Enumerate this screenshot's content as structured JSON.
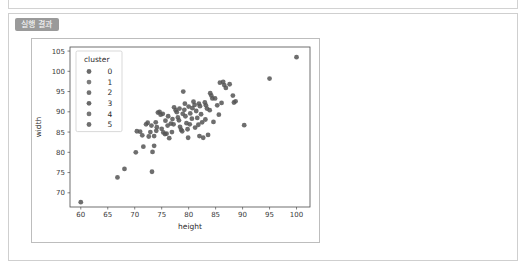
{
  "panel": {
    "result_tag": "실행 결과"
  },
  "chart_data": {
    "type": "scatter",
    "title": "",
    "xlabel": "height",
    "ylabel": "width",
    "xlim": [
      58.0,
      102.5
    ],
    "ylim": [
      66.5,
      106.0
    ],
    "xticks": [
      60,
      65,
      70,
      75,
      80,
      85,
      90,
      95,
      100
    ],
    "yticks": [
      70,
      75,
      80,
      85,
      90,
      95,
      100,
      105
    ],
    "grid": false,
    "legend": {
      "title": "cluster",
      "position": "upper left",
      "entries": [
        {
          "label": "0",
          "color": "#5a5a5a"
        },
        {
          "label": "1",
          "color": "#6e6e6e"
        },
        {
          "label": "2",
          "color": "#626262"
        },
        {
          "label": "3",
          "color": "#585858"
        },
        {
          "label": "4",
          "color": "#676767"
        },
        {
          "label": "5",
          "color": "#5f5f5f"
        }
      ]
    },
    "marker": {
      "size": 2.4,
      "color": "#555555",
      "opacity": 0.85
    },
    "points": [
      {
        "x": 60.0,
        "y": 67.7
      },
      {
        "x": 66.8,
        "y": 73.8
      },
      {
        "x": 68.1,
        "y": 75.9
      },
      {
        "x": 73.2,
        "y": 75.2
      },
      {
        "x": 70.2,
        "y": 80.0
      },
      {
        "x": 73.3,
        "y": 80.1
      },
      {
        "x": 71.6,
        "y": 81.4
      },
      {
        "x": 73.6,
        "y": 81.6
      },
      {
        "x": 70.4,
        "y": 85.2
      },
      {
        "x": 71.0,
        "y": 85.1
      },
      {
        "x": 71.4,
        "y": 84.2
      },
      {
        "x": 72.1,
        "y": 86.9
      },
      {
        "x": 72.4,
        "y": 87.3
      },
      {
        "x": 72.9,
        "y": 85.0
      },
      {
        "x": 73.1,
        "y": 86.6
      },
      {
        "x": 73.6,
        "y": 84.0
      },
      {
        "x": 74.0,
        "y": 85.3
      },
      {
        "x": 74.3,
        "y": 89.8
      },
      {
        "x": 74.6,
        "y": 90.0
      },
      {
        "x": 74.8,
        "y": 89.3
      },
      {
        "x": 75.2,
        "y": 89.5
      },
      {
        "x": 75.0,
        "y": 85.8
      },
      {
        "x": 75.3,
        "y": 84.9
      },
      {
        "x": 75.6,
        "y": 84.5
      },
      {
        "x": 75.9,
        "y": 84.6
      },
      {
        "x": 76.1,
        "y": 86.6
      },
      {
        "x": 76.4,
        "y": 83.5
      },
      {
        "x": 76.7,
        "y": 87.1
      },
      {
        "x": 77.0,
        "y": 88.2
      },
      {
        "x": 77.3,
        "y": 91.1
      },
      {
        "x": 77.6,
        "y": 90.4
      },
      {
        "x": 77.8,
        "y": 89.9
      },
      {
        "x": 78.0,
        "y": 88.6
      },
      {
        "x": 78.2,
        "y": 87.9
      },
      {
        "x": 78.4,
        "y": 86.3
      },
      {
        "x": 78.6,
        "y": 85.6
      },
      {
        "x": 78.8,
        "y": 85.2
      },
      {
        "x": 79.0,
        "y": 95.0
      },
      {
        "x": 79.2,
        "y": 90.5
      },
      {
        "x": 79.4,
        "y": 88.9
      },
      {
        "x": 79.6,
        "y": 87.2
      },
      {
        "x": 79.8,
        "y": 85.7
      },
      {
        "x": 80.0,
        "y": 91.3
      },
      {
        "x": 80.3,
        "y": 89.6
      },
      {
        "x": 80.6,
        "y": 88.3
      },
      {
        "x": 80.9,
        "y": 92.5
      },
      {
        "x": 81.1,
        "y": 91.7
      },
      {
        "x": 81.4,
        "y": 90.2
      },
      {
        "x": 81.6,
        "y": 88.5
      },
      {
        "x": 81.9,
        "y": 92.0
      },
      {
        "x": 82.1,
        "y": 91.4
      },
      {
        "x": 82.3,
        "y": 89.4
      },
      {
        "x": 82.5,
        "y": 87.4
      },
      {
        "x": 82.7,
        "y": 83.6
      },
      {
        "x": 83.0,
        "y": 92.3
      },
      {
        "x": 83.2,
        "y": 91.6
      },
      {
        "x": 83.4,
        "y": 90.8
      },
      {
        "x": 83.6,
        "y": 84.3
      },
      {
        "x": 84.0,
        "y": 94.6
      },
      {
        "x": 84.2,
        "y": 94.0
      },
      {
        "x": 84.4,
        "y": 93.3
      },
      {
        "x": 84.9,
        "y": 93.3
      },
      {
        "x": 85.3,
        "y": 91.6
      },
      {
        "x": 85.6,
        "y": 89.3
      },
      {
        "x": 85.8,
        "y": 97.2
      },
      {
        "x": 86.4,
        "y": 97.4
      },
      {
        "x": 86.6,
        "y": 96.6
      },
      {
        "x": 86.9,
        "y": 95.9
      },
      {
        "x": 87.6,
        "y": 96.8
      },
      {
        "x": 88.2,
        "y": 94.0
      },
      {
        "x": 88.4,
        "y": 92.3
      },
      {
        "x": 88.7,
        "y": 92.6
      },
      {
        "x": 90.3,
        "y": 86.7
      },
      {
        "x": 95.0,
        "y": 98.2
      },
      {
        "x": 100.0,
        "y": 103.5
      },
      {
        "x": 79.9,
        "y": 83.6
      },
      {
        "x": 76.9,
        "y": 85.0
      },
      {
        "x": 74.1,
        "y": 86.2
      },
      {
        "x": 72.6,
        "y": 83.9
      },
      {
        "x": 78.3,
        "y": 90.8
      },
      {
        "x": 80.2,
        "y": 86.9
      },
      {
        "x": 81.2,
        "y": 86.1
      },
      {
        "x": 83.1,
        "y": 88.1
      },
      {
        "x": 77.2,
        "y": 86.9
      },
      {
        "x": 75.7,
        "y": 87.8
      },
      {
        "x": 79.3,
        "y": 92.0
      },
      {
        "x": 82.0,
        "y": 84.0
      },
      {
        "x": 84.6,
        "y": 87.5
      },
      {
        "x": 86.1,
        "y": 92.2
      },
      {
        "x": 73.9,
        "y": 87.4
      },
      {
        "x": 78.9,
        "y": 89.5
      },
      {
        "x": 80.7,
        "y": 90.9
      },
      {
        "x": 76.2,
        "y": 88.9
      },
      {
        "x": 81.8,
        "y": 86.8
      },
      {
        "x": 83.9,
        "y": 90.4
      }
    ]
  }
}
